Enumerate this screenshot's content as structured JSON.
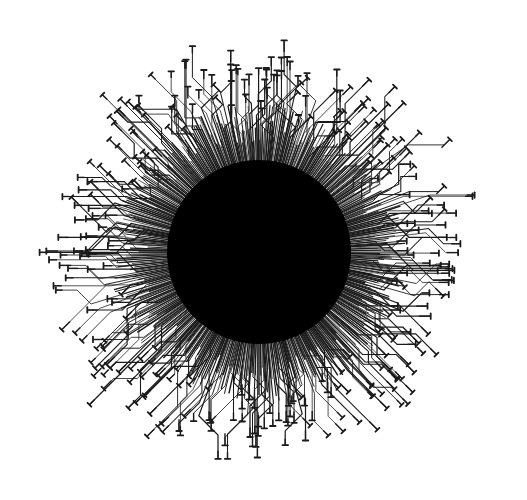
{
  "artwork": {
    "title": "Circuit sunburst",
    "description": "Black disc with circuit-board style traces radiating outward, each ending in a T-shaped pad",
    "canvas": {
      "width": 527,
      "height": 500,
      "background": "#ffffff"
    },
    "core": {
      "cx": 259,
      "cy": 252,
      "r": 92,
      "fill": "#000000"
    },
    "traces": {
      "count": 330,
      "color": "#1a1a1a",
      "stroke_width": 0.9,
      "pad_width": 5.5,
      "pad_stroke": 1.8,
      "inner_radius": 88,
      "min_length": 55,
      "max_length": 150,
      "extent_rx": 232,
      "extent_ry": 225,
      "seed": 7
    }
  }
}
